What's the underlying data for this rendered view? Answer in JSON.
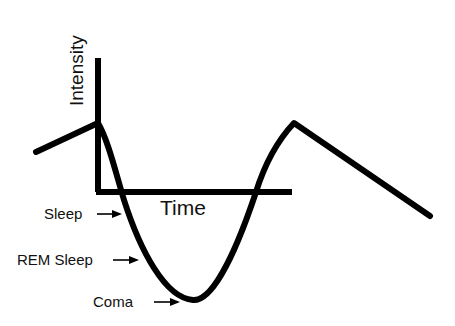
{
  "diagram": {
    "y_axis_label": "Intensity",
    "x_axis_label": "Time",
    "annotations": [
      {
        "label": "Sleep",
        "arrow": "right-arrow"
      },
      {
        "label": "REM Sleep",
        "arrow": "right-arrow"
      },
      {
        "label": "Coma",
        "arrow": "right-arrow"
      }
    ],
    "line_color": "#000000",
    "background": "#ffffff"
  }
}
